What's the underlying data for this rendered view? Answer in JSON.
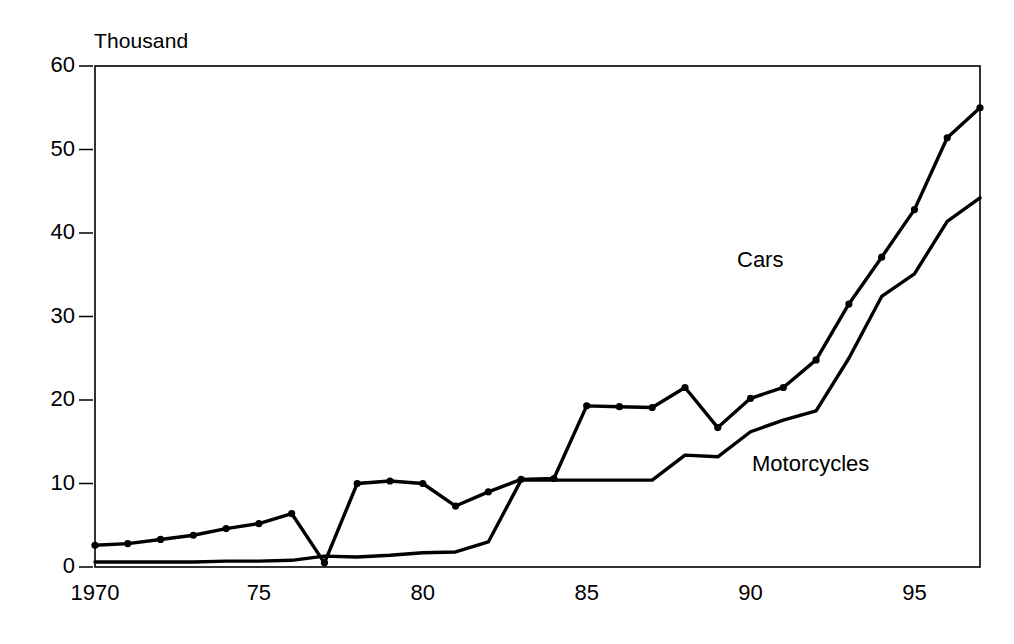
{
  "chart_data": {
    "type": "line",
    "title": "",
    "subtitle": "",
    "unit_label": "Thousand",
    "xlabel": "",
    "ylabel": "",
    "xlim": [
      1970,
      1997
    ],
    "ylim": [
      0,
      60
    ],
    "grid": false,
    "legend_position": "inline-annotations",
    "x": [
      1970,
      1971,
      1972,
      1973,
      1974,
      1975,
      1976,
      1977,
      1978,
      1979,
      1980,
      1981,
      1982,
      1983,
      1984,
      1985,
      1986,
      1987,
      1988,
      1989,
      1990,
      1991,
      1992,
      1993,
      1994,
      1995,
      1996,
      1997
    ],
    "xtick_values": [
      1970,
      1975,
      1980,
      1985,
      1990,
      1995
    ],
    "xtick_labels": [
      "1970",
      "75",
      "80",
      "85",
      "90",
      "95"
    ],
    "ytick_values": [
      0,
      10,
      20,
      30,
      40,
      50,
      60
    ],
    "ytick_labels": [
      "0",
      "10",
      "20",
      "30",
      "40",
      "50",
      "60"
    ],
    "series": [
      {
        "name": "Cars",
        "markers": true,
        "values": [
          2.6,
          2.8,
          3.3,
          3.8,
          4.6,
          5.2,
          6.4,
          0.5,
          10.0,
          10.3,
          10.0,
          7.3,
          9.0,
          10.5,
          10.6,
          19.3,
          19.2,
          19.1,
          21.5,
          16.7,
          20.2,
          21.5,
          24.8,
          31.5,
          37.1,
          42.8,
          51.4,
          55.0
        ]
      },
      {
        "name": "Motorcycles",
        "markers": false,
        "values": [
          0.6,
          0.6,
          0.6,
          0.6,
          0.7,
          0.7,
          0.8,
          1.3,
          1.2,
          1.4,
          1.7,
          1.8,
          3.0,
          10.4,
          10.4,
          10.4,
          10.4,
          10.4,
          13.4,
          13.2,
          16.2,
          17.6,
          18.7,
          25.0,
          32.4,
          35.1,
          41.4,
          44.2
        ]
      }
    ],
    "annotations": [
      {
        "text": "Cars",
        "x": 1990.7,
        "y": 34.5
      },
      {
        "text": "Motorcycles",
        "x": 1991.2,
        "y": 11.2
      },
      {
        "text": "Thousand",
        "x": 1970.1,
        "y": 62.5
      }
    ],
    "colors": {
      "series_line": "#000000",
      "axis": "#000000",
      "background": "#ffffff"
    }
  }
}
